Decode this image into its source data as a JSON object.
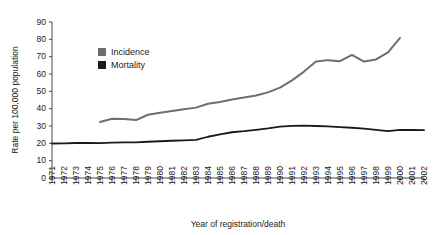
{
  "chart_data": {
    "type": "line",
    "title": "",
    "xlabel": "Year of registration/death",
    "ylabel": "Rate per 100,000 population",
    "ylim": [
      0,
      90
    ],
    "yticks": [
      0,
      10,
      20,
      30,
      40,
      50,
      60,
      70,
      80,
      90
    ],
    "grid": false,
    "legend_position": "inside-upper-left",
    "categories": [
      "1971",
      "1972",
      "1973",
      "1974",
      "1975",
      "1976",
      "1977",
      "1978",
      "1979",
      "1980",
      "1981",
      "1982",
      "1983",
      "1984",
      "1985",
      "1986",
      "1987",
      "1988",
      "1989",
      "1990",
      "1991",
      "1992",
      "1993",
      "1994",
      "1995",
      "1996",
      "1997",
      "1998",
      "1999",
      "2000",
      "2001",
      "2002"
    ],
    "series": [
      {
        "name": "Incidence",
        "color": "#6e6e6e",
        "x": [
          "1975",
          "1976",
          "1977",
          "1978",
          "1979",
          "1980",
          "1981",
          "1982",
          "1983",
          "1984",
          "1985",
          "1986",
          "1987",
          "1988",
          "1989",
          "1990",
          "1991",
          "1992",
          "1993",
          "1994",
          "1995",
          "1996",
          "1997",
          "1998",
          "1999",
          "2000"
        ],
        "values": [
          32.3,
          34.2,
          34.1,
          33.4,
          36.5,
          37.6,
          38.6,
          39.6,
          40.6,
          42.8,
          43.9,
          45.3,
          46.4,
          47.6,
          49.4,
          52.1,
          56.3,
          61.4,
          67.2,
          68.0,
          67.4,
          71.0,
          67.2,
          68.4,
          72.5,
          80.8
        ]
      },
      {
        "name": "Mortality",
        "color": "#1a1a1a",
        "x": [
          "1971",
          "1972",
          "1973",
          "1974",
          "1975",
          "1976",
          "1977",
          "1978",
          "1979",
          "1980",
          "1981",
          "1982",
          "1983",
          "1984",
          "1985",
          "1986",
          "1987",
          "1988",
          "1989",
          "1990",
          "1991",
          "1992",
          "1993",
          "1994",
          "1995",
          "1996",
          "1997",
          "1998",
          "1999",
          "2000",
          "2001",
          "2002"
        ],
        "values": [
          19.9,
          20.0,
          20.2,
          20.3,
          20.1,
          20.4,
          20.6,
          20.6,
          20.9,
          21.2,
          21.5,
          21.7,
          22.0,
          23.8,
          25.2,
          26.4,
          27.0,
          27.8,
          28.6,
          29.6,
          30.1,
          30.2,
          30.0,
          29.8,
          29.4,
          29.0,
          28.5,
          27.8,
          27.0,
          27.8,
          27.7,
          27.6
        ]
      }
    ],
    "legend": [
      {
        "label": "Incidence",
        "color": "#6e6e6e"
      },
      {
        "label": "Mortality",
        "color": "#1a1a1a"
      }
    ]
  }
}
